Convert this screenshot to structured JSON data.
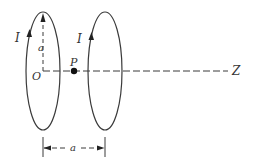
{
  "diagram": {
    "labels": {
      "current_left": "I",
      "current_right": "I",
      "radius": "a",
      "origin": "O",
      "point": "P",
      "axis": "Z",
      "separation": "a"
    },
    "colors": {
      "stroke": "#3a3a3a",
      "background": "#ffffff"
    },
    "elements": {
      "left_loop": {
        "cx": 43,
        "cy": 71,
        "rx": 17,
        "ry": 59
      },
      "right_loop": {
        "cx": 105,
        "cy": 71,
        "rx": 17,
        "ry": 59
      },
      "axis_line": {
        "x1": 43,
        "x2": 228,
        "y": 71
      },
      "point_P": {
        "x": 74,
        "y": 71
      }
    }
  }
}
